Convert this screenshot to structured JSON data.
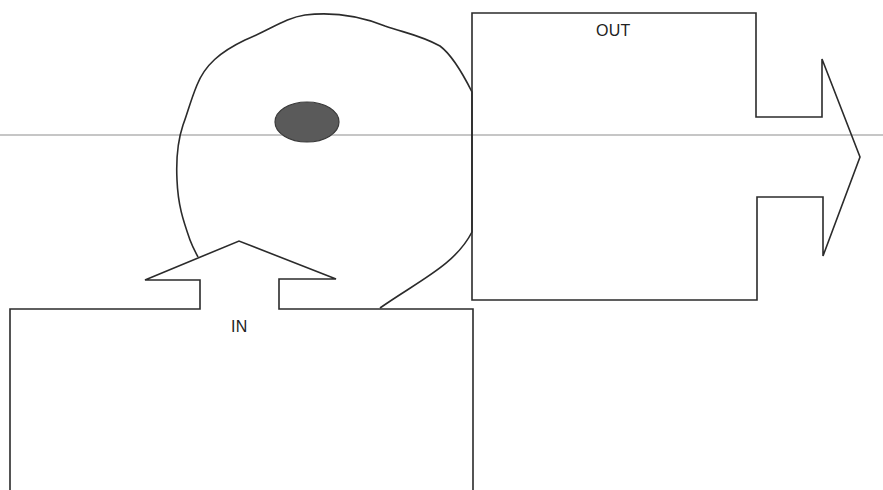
{
  "diagram": {
    "type": "cell-input-output",
    "labels": {
      "in": "IN",
      "out": "OUT"
    },
    "elements": [
      {
        "id": "cell",
        "shape": "irregular-circle",
        "description": "cell outline"
      },
      {
        "id": "nucleus",
        "shape": "ellipse",
        "fill": "#595959"
      },
      {
        "id": "in-box",
        "shape": "rectangle-with-up-arrow",
        "label": "IN"
      },
      {
        "id": "out-box",
        "shape": "rectangle-with-right-arrow",
        "label": "OUT"
      }
    ],
    "colors": {
      "stroke": "#2b2b2b",
      "nucleus_fill": "#5a5a5a",
      "scan_line": "#c8c8c8",
      "background": "#ffffff"
    }
  }
}
